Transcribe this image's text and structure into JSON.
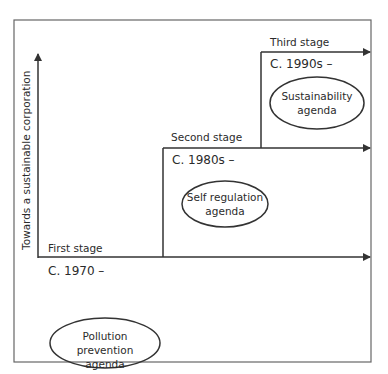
{
  "diagram": {
    "y_axis_label": "Towards a sustainable corporation",
    "stages": [
      {
        "name": "First stage",
        "period": "C. 1970 –",
        "agenda_line1": "Pollution prevention",
        "agenda_line2": "agenda"
      },
      {
        "name": "Second stage",
        "period": "C. 1980s –",
        "agenda_line1": "Self regulation",
        "agenda_line2": "agenda"
      },
      {
        "name": "Third stage",
        "period": "C. 1990s –",
        "agenda_line1": "Sustainability",
        "agenda_line2": "agenda"
      }
    ],
    "colors": {
      "line": "#333333",
      "border": "#555555",
      "background": "#ffffff"
    }
  }
}
